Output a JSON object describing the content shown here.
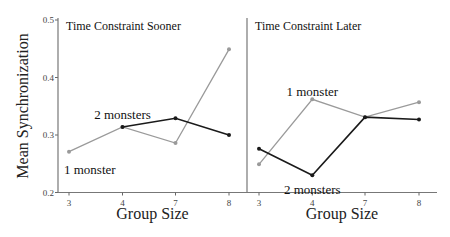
{
  "chart_data": {
    "type": "line",
    "ylabel": "Mean Synchronization",
    "xlabel": "Group Size",
    "ylim": [
      0.2,
      0.5
    ],
    "yticks": [
      "0.2",
      "0.3",
      "0.4",
      "0.5"
    ],
    "categories": [
      "3",
      "4",
      "7",
      "8"
    ],
    "grid": false,
    "legend": "inline labels",
    "colors": {
      "1 monster": "#9a9a9a",
      "2 monsters": "#1a1a1a"
    },
    "panels": [
      {
        "title": "Time Constraint Sooner",
        "series": [
          {
            "name": "1 monster",
            "values": [
              0.271,
              0.314,
              0.286,
              0.449
            ]
          },
          {
            "name": "2 monsters",
            "values": [
              null,
              0.314,
              0.329,
              0.3
            ]
          }
        ],
        "annotations": [
          {
            "text": "1 monster",
            "x": "3",
            "y": 0.24
          },
          {
            "text": "2 monsters",
            "x": "4",
            "y": 0.335
          }
        ]
      },
      {
        "title": "Time Constraint Later",
        "series": [
          {
            "name": "1 monster",
            "values": [
              0.249,
              0.362,
              0.331,
              0.357
            ]
          },
          {
            "name": "2 monsters",
            "values": [
              0.276,
              0.23,
              0.331,
              0.327
            ]
          }
        ],
        "annotations": [
          {
            "text": "1 monster",
            "x": "4",
            "y": 0.375
          },
          {
            "text": "2 monsters",
            "x": "4",
            "y": 0.205
          }
        ]
      }
    ]
  }
}
